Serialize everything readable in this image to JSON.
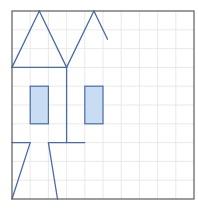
{
  "figure": {
    "colors": {
      "background": "#ffffff",
      "grid": "#e3e3e3",
      "border": "#5a5a5a",
      "stroke": "#4a6aa8",
      "fill": "#c8dcf2"
    },
    "grid": {
      "x0": 12,
      "y0": 11,
      "x1": 194,
      "y1": 199,
      "cols": 10,
      "rows": 10
    },
    "segments": [
      {
        "name": "left-roof-left-edge",
        "from": [
          0,
          3
        ],
        "to": [
          1.5,
          0
        ]
      },
      {
        "name": "left-roof-right-edge",
        "from": [
          1.5,
          0
        ],
        "to": [
          3,
          3
        ]
      },
      {
        "name": "right-roof-left-edge",
        "from": [
          3,
          3
        ],
        "to": [
          4.5,
          0
        ]
      },
      {
        "name": "right-roof-right-edge",
        "from": [
          4.5,
          0
        ],
        "to": [
          5.25,
          1.5
        ]
      },
      {
        "name": "eave-line",
        "from": [
          0,
          3
        ],
        "to": [
          3,
          3
        ]
      },
      {
        "name": "center-wall",
        "from": [
          3,
          3
        ],
        "to": [
          3,
          7
        ]
      },
      {
        "name": "floor-line-right",
        "from": [
          2,
          7
        ],
        "to": [
          4,
          7
        ]
      },
      {
        "name": "floor-line-left",
        "from": [
          0,
          7
        ],
        "to": [
          1,
          7
        ]
      },
      {
        "name": "left-leg",
        "from": [
          1,
          7
        ],
        "to": [
          0,
          10
        ]
      },
      {
        "name": "right-leg",
        "from": [
          2,
          7
        ],
        "to": [
          2.5,
          10
        ]
      }
    ],
    "rectangles": [
      {
        "name": "window-left",
        "x": 1,
        "y": 4,
        "w": 1,
        "h": 2
      },
      {
        "name": "window-right",
        "x": 4,
        "y": 4,
        "w": 1,
        "h": 2
      }
    ]
  }
}
